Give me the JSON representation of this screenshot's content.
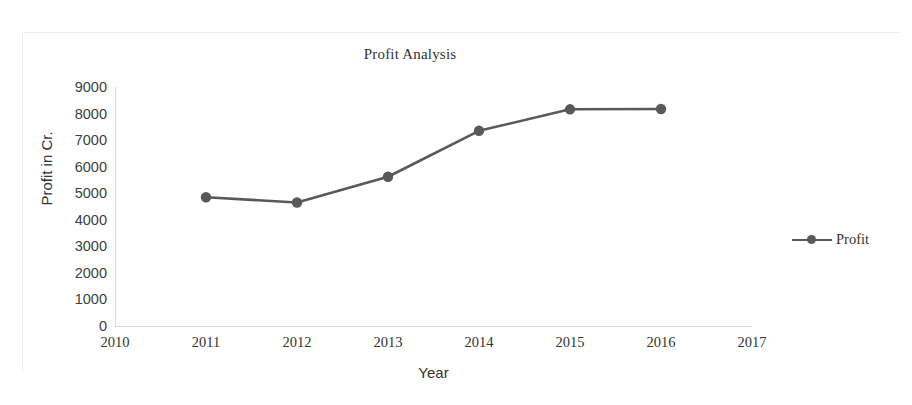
{
  "chart_data": {
    "type": "line",
    "title": "Profit Analysis",
    "xlabel": "Year",
    "ylabel": "Profit in Cr.",
    "x": [
      2011,
      2012,
      2013,
      2014,
      2015,
      2016
    ],
    "categories": [
      "2011",
      "2012",
      "2013",
      "2014",
      "2015",
      "2016"
    ],
    "series": [
      {
        "name": "Profit",
        "values": [
          4850,
          4650,
          5620,
          7350,
          8160,
          8170
        ],
        "color": "#595959",
        "marker": "circle"
      }
    ],
    "xlim": [
      2010,
      2017
    ],
    "ylim": [
      0,
      9000
    ],
    "xticks": [
      "2010",
      "2011",
      "2012",
      "2013",
      "2014",
      "2015",
      "2016",
      "2017"
    ],
    "yticks": [
      "0",
      "1000",
      "2000",
      "3000",
      "4000",
      "5000",
      "6000",
      "7000",
      "8000",
      "9000"
    ],
    "grid": false,
    "legend_position": "right"
  },
  "legend": {
    "entries": [
      {
        "label": "Profit",
        "color": "#595959"
      }
    ]
  },
  "colors": {
    "series": "#595959",
    "axis": "#d9d9d9",
    "text": "#333333",
    "tick_text": "#404040",
    "background": "#ffffff"
  }
}
